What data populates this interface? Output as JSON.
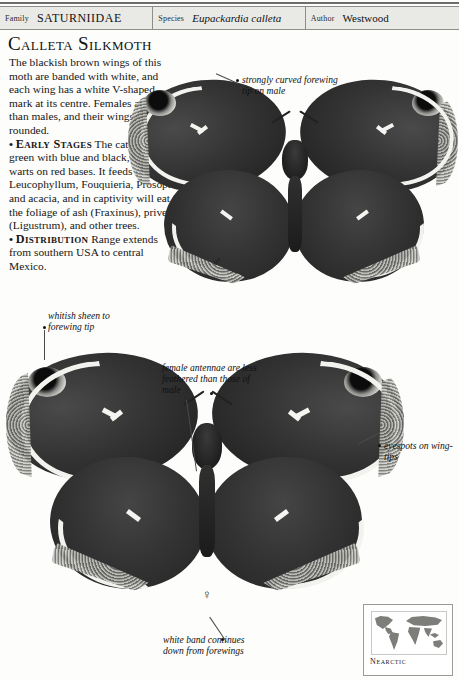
{
  "header": {
    "fields": [
      {
        "key": "Family",
        "value": "SATURNIIDAE",
        "style": "smallcaps"
      },
      {
        "key": "Species",
        "value": "Eupackardia calleta",
        "style": "italic"
      },
      {
        "key": "Author",
        "value": "Westwood",
        "style": "plain"
      }
    ]
  },
  "page_title": "Calleta Silkmoth",
  "description": {
    "intro": "The blackish brown wings of this moth are banded with white, and each wing has a white V-shaped mark at its centre. Females are larger than males, and their wings are more rounded.",
    "sections": [
      {
        "bullet": "•",
        "heading": "Early Stages",
        "text": " The caterpillar is green with blue and black, spiny warts on red bases. It feeds on Leucophyllum, Fouquieria, Prosopis, and acacia, and in captivity will eat the foliage of ash (Fraxinus), privet (Ligustrum), and other trees."
      },
      {
        "bullet": "•",
        "heading": "Distribution",
        "text": " Range extends from southern USA to central Mexico."
      }
    ],
    "italic_terms": [
      "Leucophyllum",
      "Fouquieria",
      "Prosopis",
      "(Fraxinus)",
      "(Ligustrum)"
    ]
  },
  "annotations": [
    {
      "id": "forewing-tip-male",
      "text": "strongly curved forewing tip on male"
    },
    {
      "id": "whitish-sheen",
      "text": "whitish sheen to forewing tip"
    },
    {
      "id": "female-antennae",
      "text": "female antennae are less feathered than those of male"
    },
    {
      "id": "eyespots",
      "text": "eyespots on wing-tips"
    },
    {
      "id": "white-band",
      "text": "white band continues down from forewings"
    }
  ],
  "specimens": [
    {
      "id": "male-specimen",
      "sex_symbol": "♂",
      "sex": "male"
    },
    {
      "id": "female-specimen",
      "sex_symbol": "♀",
      "sex": "female"
    }
  ],
  "map": {
    "region_label": "Nearctic"
  },
  "colors": {
    "page_bg": "#fdfdfb",
    "header_bg": "#e9e9e6",
    "rule": "#6d6d6d",
    "text": "#111111",
    "wing_dark": "#2f2f2f",
    "band_white": "#f2f2ee",
    "map_land": "#7d7d79"
  }
}
